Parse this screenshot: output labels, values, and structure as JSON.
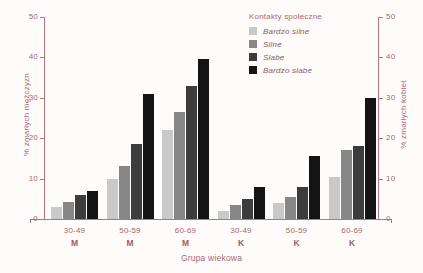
{
  "legend": {
    "title": "Kontakty społeczne",
    "entries": [
      {
        "label": "Bardzo silne",
        "color": "#c9c9c9"
      },
      {
        "label": "Silne",
        "color": "#878787"
      },
      {
        "label": "Słabe",
        "color": "#3c3c3c"
      },
      {
        "label": "Bardzo słabe",
        "color": "#141414"
      }
    ]
  },
  "axes": {
    "left_title": "% zmarłych mężczyzn",
    "right_title": "% zmarłych kobiet",
    "x_title": "Grupa wiekowa",
    "ticks": [
      "0",
      "10",
      "20",
      "30",
      "40",
      "50"
    ]
  },
  "groups": [
    {
      "age": "30-49",
      "sex": "M"
    },
    {
      "age": "50-59",
      "sex": "M"
    },
    {
      "age": "60-69",
      "sex": "M"
    },
    {
      "age": "30-49",
      "sex": "K"
    },
    {
      "age": "50-59",
      "sex": "K"
    },
    {
      "age": "60-69",
      "sex": "K"
    }
  ],
  "chart_data": {
    "type": "bar",
    "title": "",
    "xlabel": "Grupa wiekowa",
    "ylabel": "% zmarłych mężczyzn",
    "ylabel_secondary": "% zmarłych kobiet",
    "ylim": [
      0,
      50
    ],
    "yticks": [
      0,
      10,
      20,
      30,
      40,
      50
    ],
    "grid": false,
    "legend_title": "Kontakty społeczne",
    "legend_position": "top-right",
    "categories": [
      "30-49 M",
      "50-59 M",
      "60-69 M",
      "30-49 K",
      "50-59 K",
      "60-69 K"
    ],
    "series": [
      {
        "name": "Bardzo silne",
        "color": "#c9c9c9",
        "values": [
          3.0,
          10.0,
          22.0,
          2.0,
          4.0,
          10.5
        ]
      },
      {
        "name": "Silne",
        "color": "#878787",
        "values": [
          4.3,
          13.0,
          26.5,
          3.5,
          5.5,
          17.0
        ]
      },
      {
        "name": "Słabe",
        "color": "#3c3c3c",
        "values": [
          6.0,
          18.5,
          33.0,
          5.0,
          8.0,
          18.0
        ]
      },
      {
        "name": "Bardzo słabe",
        "color": "#141414",
        "values": [
          7.0,
          31.0,
          39.5,
          8.0,
          15.5,
          30.0
        ]
      }
    ]
  }
}
